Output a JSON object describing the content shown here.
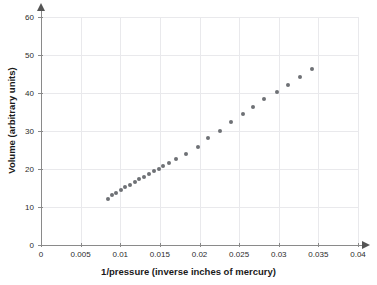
{
  "chart_data": {
    "type": "scatter",
    "title": "",
    "xlabel": "1/pressure (inverse inches of mercury)",
    "ylabel": "Volume (arbitrary units)",
    "xlim": [
      0,
      0.04
    ],
    "ylim": [
      0,
      60
    ],
    "grid": true,
    "legend": null,
    "marker": {
      "shape": "circle",
      "color": "#6e7175",
      "size_px": 4
    },
    "xticks": [
      0,
      0.005,
      0.01,
      0.015,
      0.02,
      0.025,
      0.03,
      0.035,
      0.04
    ],
    "xtick_labels": [
      "0",
      "0.005",
      "0.01",
      "0.015",
      "0.02",
      "0.025",
      "0.03",
      "0.035",
      "0.04"
    ],
    "yticks": [
      0,
      10,
      20,
      30,
      40,
      50,
      60
    ],
    "ytick_labels": [
      "0",
      "10",
      "20",
      "30",
      "40",
      "50",
      "60"
    ],
    "x": [
      0.00846,
      0.00902,
      0.00943,
      0.01006,
      0.01064,
      0.0112,
      0.0118,
      0.01238,
      0.013,
      0.01365,
      0.01425,
      0.01483,
      0.01545,
      0.0161,
      0.017,
      0.01835,
      0.0198,
      0.0211,
      0.02255,
      0.02395,
      0.02545,
      0.02675,
      0.0282,
      0.02975,
      0.0312,
      0.03265,
      0.0342
    ],
    "y": [
      12.2,
      13.1,
      13.7,
      14.5,
      15.2,
      15.9,
      16.6,
      17.3,
      18.0,
      18.8,
      19.5,
      20.1,
      20.8,
      21.6,
      22.6,
      23.9,
      25.9,
      28.1,
      30.1,
      32.3,
      34.4,
      36.2,
      38.3,
      40.2,
      42.2,
      44.3,
      46.3
    ],
    "relationship": "linear"
  },
  "axes": {
    "x_label": "1/pressure (inverse inches of mercury)",
    "y_label": "Volume (arbitrary units)"
  }
}
